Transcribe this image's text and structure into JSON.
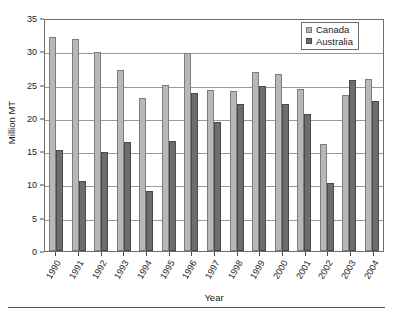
{
  "chart_data": {
    "type": "bar",
    "title": "",
    "xlabel": "Year",
    "ylabel": "Million MT",
    "ylim": [
      0,
      35
    ],
    "ytick_values": [
      35,
      30,
      25,
      20,
      15,
      10,
      5,
      0
    ],
    "ytick_labels": [
      "35",
      "30",
      "25",
      "20",
      "15",
      "10",
      "5",
      "0"
    ],
    "grid": true,
    "legend_position": "top-right",
    "categories": [
      "1990",
      "1991",
      "1992",
      "1993",
      "1994",
      "1995",
      "1996",
      "1997",
      "1998",
      "1999",
      "2000",
      "2001",
      "2002",
      "2003",
      "2004"
    ],
    "series": [
      {
        "name": "Canada",
        "color": "#b8b8b8",
        "values": [
          32.1,
          31.9,
          29.9,
          27.2,
          23.0,
          25.0,
          29.8,
          24.2,
          24.1,
          26.9,
          26.6,
          24.4,
          16.1,
          23.5,
          25.8
        ]
      },
      {
        "name": "Australia",
        "color": "#6d6d6d",
        "values": [
          15.1,
          10.5,
          14.8,
          16.4,
          9.0,
          16.5,
          23.7,
          19.4,
          22.1,
          24.8,
          22.1,
          20.6,
          10.2,
          25.7,
          22.6
        ]
      }
    ]
  },
  "legend": {
    "entries": [
      {
        "label": "Canada",
        "swatch": "canada"
      },
      {
        "label": "Australia",
        "swatch": "australia"
      }
    ]
  }
}
